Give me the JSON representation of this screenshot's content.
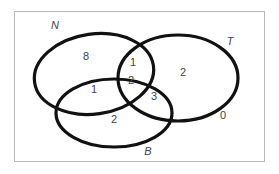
{
  "diagram": {
    "type": "venn",
    "sets": [
      {
        "name": "N",
        "label": "N"
      },
      {
        "name": "T",
        "label": "T"
      },
      {
        "name": "B",
        "label": "B"
      }
    ],
    "regions": {
      "N_only": "8",
      "N_and_T_only": "1",
      "N_T_B": "2",
      "N_and_B_only": "1",
      "T_only": "2",
      "T_and_B_only": "3",
      "B_only": "2",
      "outside": "0"
    }
  }
}
